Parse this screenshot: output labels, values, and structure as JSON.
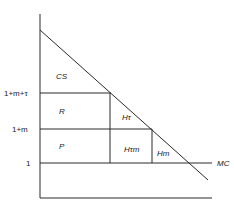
{
  "diagram": {
    "y_ticks": [
      {
        "label": "1+m+τ",
        "y": 93
      },
      {
        "label": "1+m",
        "y": 129
      },
      {
        "label": "1",
        "y": 163
      }
    ],
    "regions": {
      "cs": "CS",
      "r": "R",
      "p": "P",
      "h_tau": "Hτ",
      "h_tau_m": "Hτm",
      "h_m": "Hm"
    },
    "curves": {
      "mc": "MC"
    }
  }
}
